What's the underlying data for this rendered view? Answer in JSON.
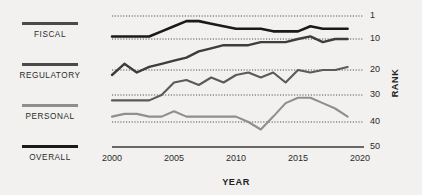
{
  "legend": {
    "items": [
      {
        "label": "FISCAL",
        "color": "#4a4a4a"
      },
      {
        "label": "REGULATORY",
        "color": "#4a4a4a"
      },
      {
        "label": "PERSONAL",
        "color": "#8e8e8e"
      },
      {
        "label": "OVERALL",
        "color": "#1a1a1a"
      }
    ]
  },
  "chart_data": {
    "type": "line",
    "title": "",
    "xlabel": "YEAR",
    "ylabel": "RANK",
    "xlim": [
      2000,
      2020
    ],
    "ylim": [
      1,
      50
    ],
    "y_inverted": true,
    "grid": true,
    "gridlines": [
      1,
      10,
      20,
      30,
      40,
      50
    ],
    "xticks": [
      2000,
      2005,
      2010,
      2015,
      2020
    ],
    "xtick_labels": [
      "2000",
      "2005",
      "2010",
      "2015",
      "2020"
    ],
    "ytick_labels": [
      "1",
      "10",
      "20",
      "30",
      "40",
      "50"
    ],
    "legend_position": "left",
    "x": [
      2000,
      2001,
      2002,
      2003,
      2004,
      2005,
      2006,
      2007,
      2008,
      2009,
      2010,
      2011,
      2012,
      2013,
      2014,
      2015,
      2016,
      2017,
      2018,
      2019
    ],
    "series": [
      {
        "name": "OVERALL",
        "color": "#1a1a1a",
        "width": 2.6,
        "values": [
          9,
          9,
          9,
          9,
          7,
          5,
          3,
          3,
          4,
          5,
          6,
          6,
          6,
          7,
          7,
          7,
          5,
          6,
          6,
          6
        ]
      },
      {
        "name": "FISCAL",
        "color": "#3d3d3d",
        "width": 2.4,
        "values": [
          22,
          18,
          21,
          19,
          18,
          17,
          16,
          14,
          13,
          12,
          12,
          12,
          11,
          11,
          11,
          10,
          9,
          11,
          10,
          10
        ]
      },
      {
        "name": "REGULATORY",
        "color": "#5a5a5a",
        "width": 2.1,
        "values": [
          32,
          32,
          32,
          32,
          30,
          25,
          24,
          26,
          23,
          25,
          22,
          21,
          23,
          21,
          25,
          20,
          21,
          20,
          20,
          19
        ]
      },
      {
        "name": "PERSONAL",
        "color": "#8f8f8f",
        "width": 2.1,
        "values": [
          38,
          37,
          37,
          38,
          38,
          36,
          38,
          38,
          38,
          38,
          38,
          40,
          43,
          38,
          33,
          31,
          31,
          33,
          35,
          38
        ]
      }
    ]
  }
}
